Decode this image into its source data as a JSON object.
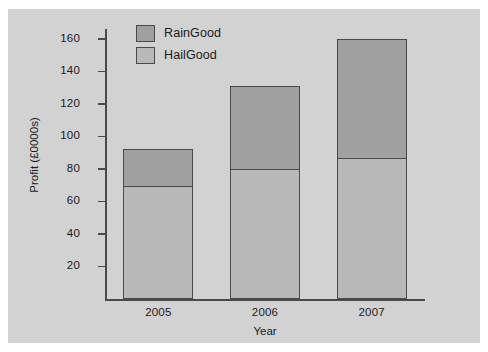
{
  "chart_data": {
    "type": "bar",
    "subtype": "stacked",
    "title": "",
    "xlabel": "Year",
    "ylabel": "Profit (£0000s)",
    "categories": [
      "2005",
      "2006",
      "2007"
    ],
    "series": [
      {
        "name": "HailGood",
        "values": [
          70,
          80,
          87
        ],
        "color": "#b8b8b8"
      },
      {
        "name": "RainGood",
        "values": [
          22,
          51,
          73
        ],
        "color": "#a0a0a0"
      }
    ],
    "totals": [
      92,
      131,
      160
    ],
    "ylim": [
      0,
      166
    ],
    "yticks": [
      20,
      40,
      60,
      80,
      100,
      120,
      140,
      160
    ],
    "ytick_labels": [
      "20",
      "40",
      "60",
      "80",
      "100",
      "120",
      "140",
      "160"
    ],
    "grid": false,
    "legend_position": "top-left-inside",
    "legend_entries": [
      "RainGood",
      "HailGood"
    ],
    "background_color": "#d2d2d2",
    "axis_color": "#4a4a4a"
  },
  "figure": {
    "background_color": "#d2d2d2",
    "page_background": "#ffffff"
  }
}
